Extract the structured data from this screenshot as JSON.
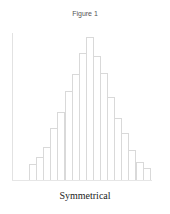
{
  "figure": {
    "title": "Figure 1",
    "caption": "Symmetrical"
  },
  "chart_data": {
    "type": "bar",
    "title": "Figure 1",
    "subtitle": "Symmetrical",
    "xlabel": "",
    "ylabel": "",
    "grid": false,
    "legend": null,
    "categories": [
      "1",
      "2",
      "3",
      "4",
      "5",
      "6",
      "7",
      "8",
      "9",
      "10",
      "11",
      "12",
      "13",
      "14",
      "15",
      "16",
      "17"
    ],
    "values": [
      16,
      23,
      34,
      53,
      69,
      91,
      108,
      130,
      146,
      127,
      109,
      85,
      63,
      48,
      31,
      18,
      12
    ],
    "ylim": [
      0,
      150
    ],
    "color": "#d9d9d9"
  }
}
